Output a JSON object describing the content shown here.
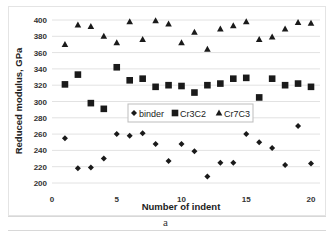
{
  "chart_data": {
    "type": "scatter",
    "title": "",
    "xlabel": "Number of indent",
    "ylabel": "Reduced modulus, GPa",
    "xlim": [
      0,
      20
    ],
    "ylim": [
      200,
      400
    ],
    "x_ticks": [
      0,
      5,
      10,
      15,
      20
    ],
    "y_ticks": [
      200,
      220,
      240,
      260,
      280,
      300,
      320,
      340,
      360,
      380,
      400
    ],
    "grid": "horizontal",
    "legend_position": "inside-center",
    "x": [
      1,
      2,
      3,
      4,
      5,
      6,
      7,
      8,
      9,
      10,
      11,
      12,
      13,
      14,
      15,
      16,
      17,
      18,
      19,
      20
    ],
    "series": [
      {
        "name": "binder",
        "marker": "diamond",
        "color": "#1a1a1a",
        "values": [
          255,
          218,
          219,
          230,
          260,
          258,
          261,
          248,
          227,
          248,
          239,
          208,
          225,
          225,
          260,
          250,
          243,
          222,
          270,
          224
        ]
      },
      {
        "name": "Cr3C2",
        "marker": "square",
        "color": "#1a1a1a",
        "values": [
          321,
          333,
          298,
          291,
          342,
          326,
          328,
          318,
          320,
          319,
          311,
          320,
          322,
          328,
          329,
          305,
          328,
          320,
          322,
          318
        ]
      },
      {
        "name": "Cr7C3",
        "marker": "triangle",
        "color": "#1a1a1a",
        "values": [
          370,
          394,
          392,
          380,
          372,
          398,
          376,
          399,
          395,
          372,
          385,
          364,
          389,
          393,
          398,
          376,
          379,
          389,
          397,
          396
        ]
      }
    ]
  },
  "caption": "a"
}
